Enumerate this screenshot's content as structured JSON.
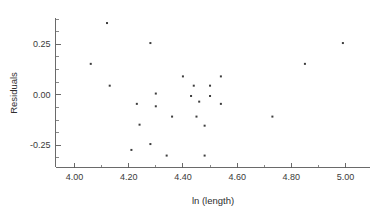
{
  "chart_data": {
    "type": "scatter",
    "title": "",
    "xlabel": "ln (length)",
    "ylabel": "Residuals",
    "xlim": [
      3.93,
      5.09
    ],
    "ylim": [
      -0.36,
      0.38
    ],
    "grid": false,
    "legend": null,
    "x_ticks": [
      "4.00",
      "4.20",
      "4.40",
      "4.60",
      "4.80",
      "5.00"
    ],
    "x_tick_values": [
      4.0,
      4.2,
      4.4,
      4.6,
      4.8,
      5.0
    ],
    "x_minor_tick_values": [
      4.1,
      4.3,
      4.5,
      4.7,
      4.9
    ],
    "y_ticks": [
      "0.25",
      "0.00",
      "-0.25"
    ],
    "y_tick_values": [
      0.25,
      0.0,
      -0.25
    ],
    "y_minor_tick_values": [
      0.3125,
      0.1875,
      0.125,
      0.0625,
      -0.0625,
      -0.125,
      -0.1875,
      -0.3125,
      0.375,
      -0.375
    ],
    "marker": "square",
    "marker_size": 2,
    "marker_color": "#3d3d3d",
    "points": [
      {
        "x": 4.12,
        "y": 0.355
      },
      {
        "x": 4.06,
        "y": 0.153
      },
      {
        "x": 4.28,
        "y": 0.256
      },
      {
        "x": 4.99,
        "y": 0.256
      },
      {
        "x": 4.85,
        "y": 0.153
      },
      {
        "x": 4.13,
        "y": 0.045
      },
      {
        "x": 4.4,
        "y": 0.091
      },
      {
        "x": 4.54,
        "y": 0.091
      },
      {
        "x": 4.44,
        "y": 0.045
      },
      {
        "x": 4.5,
        "y": 0.045
      },
      {
        "x": 4.3,
        "y": 0.006
      },
      {
        "x": 4.43,
        "y": -0.006
      },
      {
        "x": 4.5,
        "y": -0.006
      },
      {
        "x": 4.23,
        "y": -0.045
      },
      {
        "x": 4.3,
        "y": -0.057
      },
      {
        "x": 4.46,
        "y": -0.034
      },
      {
        "x": 4.54,
        "y": -0.045
      },
      {
        "x": 4.36,
        "y": -0.108
      },
      {
        "x": 4.45,
        "y": -0.108
      },
      {
        "x": 4.73,
        "y": -0.108
      },
      {
        "x": 4.24,
        "y": -0.148
      },
      {
        "x": 4.48,
        "y": -0.153
      },
      {
        "x": 4.28,
        "y": -0.244
      },
      {
        "x": 4.21,
        "y": -0.273
      },
      {
        "x": 4.34,
        "y": -0.301
      },
      {
        "x": 4.48,
        "y": -0.301
      }
    ]
  },
  "axes": {
    "x_axis_name": "x-axis",
    "y_axis_name": "y-axis"
  }
}
